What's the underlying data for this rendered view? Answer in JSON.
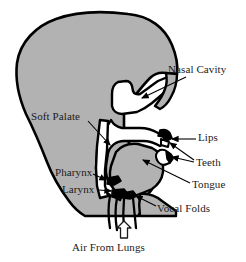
{
  "figure": {
    "background_color": "#ffffff",
    "tissue_color": "#b2b2b2",
    "cavity_color": "#ffffff",
    "outline_color": "#000000",
    "text_color": "#1a1a1a"
  },
  "labels": {
    "nasal_cavity": "Nasal Cavity",
    "soft_palate": "Soft Palate",
    "lips": "Lips",
    "teeth": "Teeth",
    "pharynx": "Pharynx",
    "larynx": "Larynx",
    "tongue": "Tongue",
    "vocal_folds": "Vocal Folds",
    "air_from_lungs": "Air From Lungs"
  },
  "annotations": {
    "air_flow_arrow": "hollow-up-arrow"
  }
}
